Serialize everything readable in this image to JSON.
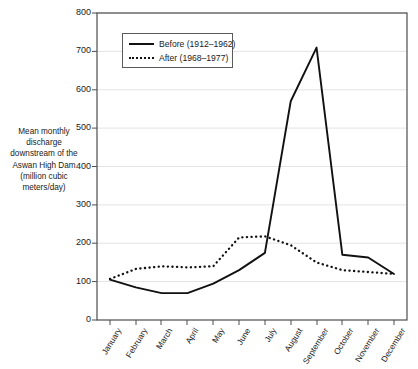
{
  "chart_data": {
    "type": "line",
    "title": "",
    "xlabel": "",
    "ylabel": "Mean monthly discharge downstream of the Aswan High Dam (million cubic meters/day)",
    "categories": [
      "January",
      "February",
      "March",
      "April",
      "May",
      "June",
      "July",
      "August",
      "September",
      "October",
      "November",
      "December"
    ],
    "ylim": [
      0,
      800
    ],
    "ytick_values": [
      0,
      100,
      200,
      300,
      400,
      500,
      600,
      700,
      800
    ],
    "grid": "horizontal",
    "legend_position": "top-left-inside",
    "series": [
      {
        "name": "Before (1912–1962)",
        "style": "solid",
        "color": "#111111",
        "values": [
          105,
          85,
          70,
          70,
          95,
          130,
          175,
          570,
          710,
          170,
          163,
          120
        ]
      },
      {
        "name": "After (1968–1977)",
        "style": "dotted",
        "color": "#111111",
        "values": [
          107,
          133,
          140,
          137,
          140,
          215,
          218,
          195,
          150,
          130,
          125,
          120
        ]
      }
    ]
  },
  "yaxis": {
    "label_lines": [
      "Mean monthly",
      "discharge",
      "downstream of the",
      "Aswan High Dam",
      "(million cubic",
      "meters/day)"
    ],
    "ticks": [
      "800",
      "700",
      "600",
      "500",
      "400",
      "300",
      "200",
      "100",
      "0"
    ]
  },
  "xaxis": {
    "ticks": [
      "January",
      "February",
      "March",
      "April",
      "May",
      "June",
      "July",
      "August",
      "September",
      "October",
      "November",
      "December"
    ]
  },
  "legend": {
    "items": [
      {
        "label": "Before (1912–1962)"
      },
      {
        "label": "After (1968–1977)"
      }
    ]
  },
  "colors": {
    "line": "#111111",
    "grid": "#e3e3e3",
    "frame": "#4d4d4d",
    "text": "#1a1a1a"
  }
}
